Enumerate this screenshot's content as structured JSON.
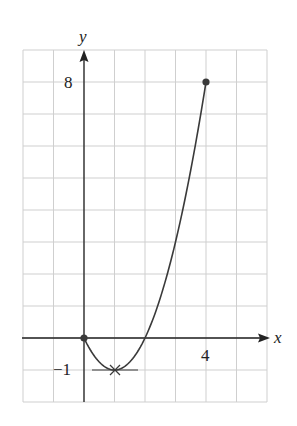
{
  "chart_data": {
    "type": "line",
    "title": "",
    "xlabel": "x",
    "ylabel": "y",
    "function": "y = x^2 - 2x",
    "x": [
      0,
      0.5,
      1,
      1.5,
      2,
      2.5,
      3,
      3.5,
      4
    ],
    "y": [
      0,
      -0.75,
      -1,
      -0.75,
      0,
      1.25,
      3,
      5.25,
      8
    ],
    "endpoints": [
      {
        "x": 0,
        "y": 0,
        "marker": "filled-dot"
      },
      {
        "x": 4,
        "y": 8,
        "marker": "filled-dot"
      }
    ],
    "minimum": {
      "x": 1,
      "y": -1,
      "marker": "x-cross",
      "tangent": "horizontal"
    },
    "tick_labels": {
      "x": [
        "4"
      ],
      "y": [
        "8",
        "−1"
      ]
    },
    "xlim": [
      -2,
      6
    ],
    "ylim": [
      -2,
      9
    ],
    "grid": true,
    "legend": null,
    "colors": {
      "curve": "#3a3a3a",
      "axis": "#222222",
      "grid": "#cfcfcf"
    }
  },
  "labels": {
    "x_axis": "x",
    "y_axis": "y",
    "tick_x_4": "4",
    "tick_y_8": "8",
    "tick_y_neg1": "−1"
  }
}
